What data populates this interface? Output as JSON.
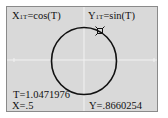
{
  "calculator": {
    "mode": "parametric",
    "equations": {
      "x": {
        "name": "X",
        "subscript": "1T",
        "expr": "=cos(T)"
      },
      "y": {
        "name": "Y",
        "subscript": "1T",
        "expr": "=sin(T)"
      }
    },
    "trace": {
      "t_label": "T=1.0471976",
      "x_label": "X=.5",
      "y_label": "Y=.8660254",
      "t": 1.0471976,
      "x": 0.5,
      "y": 0.8660254
    },
    "colors": {
      "screen_bg": "#d9d9d9",
      "curve": "#111111",
      "axes": "#f2f2f2"
    }
  }
}
